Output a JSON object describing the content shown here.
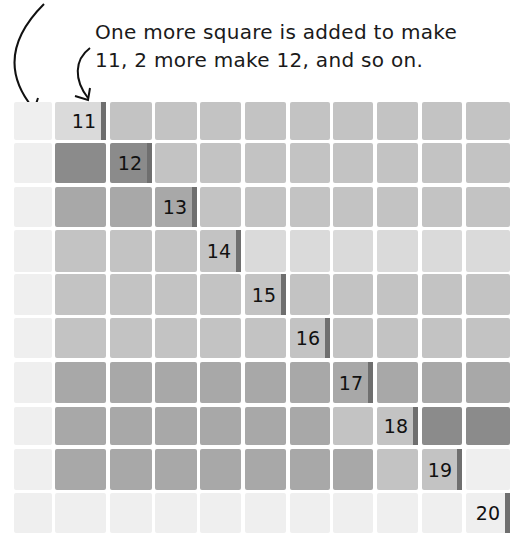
{
  "annotation": {
    "line1": "One more square is added to make",
    "line2": "11, 2 more make 12, and so on."
  },
  "colors": {
    "very_light": "#efefef",
    "light": "#dadada",
    "mid": "#c3c3c3",
    "mid_dark": "#a8a8a8",
    "dark": "#8b8b8b",
    "bar": "#6f6f6f"
  },
  "rows": [
    {
      "label": "11",
      "marked_col": 1
    },
    {
      "label": "12",
      "marked_col": 2
    },
    {
      "label": "13",
      "marked_col": 3
    },
    {
      "label": "14",
      "marked_col": 4
    },
    {
      "label": "15",
      "marked_col": 5
    },
    {
      "label": "16",
      "marked_col": 6
    },
    {
      "label": "17",
      "marked_col": 7
    },
    {
      "label": "18",
      "marked_col": 8
    },
    {
      "label": "19",
      "marked_col": 9
    },
    {
      "label": "20",
      "marked_col": 10
    }
  ]
}
